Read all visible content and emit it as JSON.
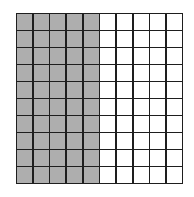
{
  "diagram": {
    "type": "hundred-grid",
    "rows": 10,
    "columns": 10,
    "shaded_columns": 5,
    "shaded_cells": 50,
    "total_cells": 100,
    "colors": {
      "shaded": "#aeaeae",
      "unshaded": "#ffffff",
      "lines": "#1e1e1e"
    }
  }
}
